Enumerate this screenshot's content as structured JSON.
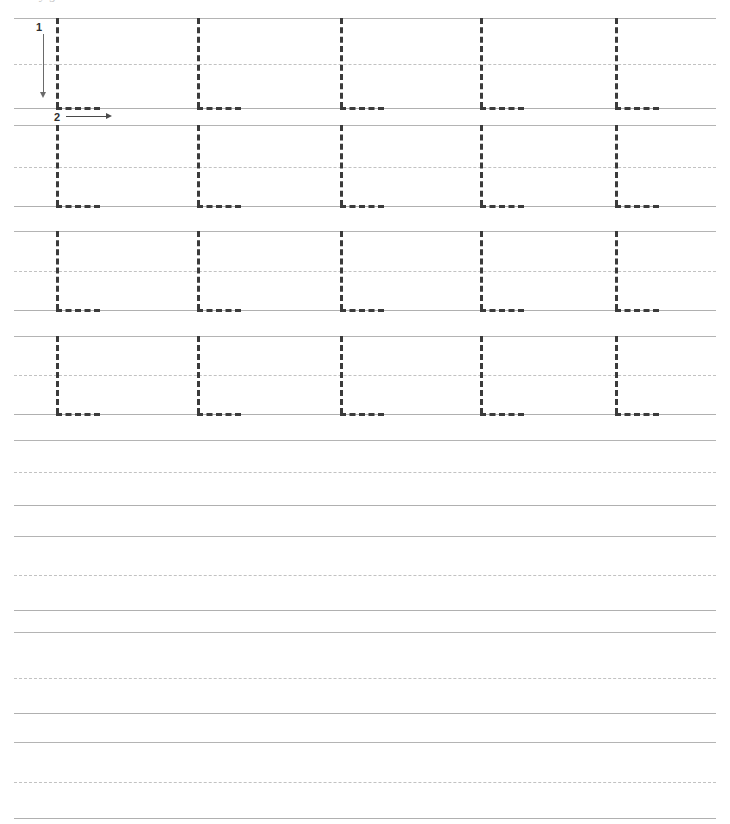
{
  "worksheet": {
    "letter": "L",
    "letter_case": "uppercase",
    "title_remnant": "y g",
    "page_width": 730,
    "page_height": 824,
    "colors": {
      "paper": "#ffffff",
      "rule_solid": "#b4b4b4",
      "rule_dashed": "#c2c2c2",
      "trace_letter": "#3b3b3b",
      "stroke_arrow": "#6a6a6a",
      "stroke_label": "#2e2e2e"
    },
    "layout": {
      "margin_left": 14,
      "margin_right": 14,
      "rule_width": 702,
      "row_height": 92,
      "letter_columns": [
        56,
        197,
        340,
        480,
        615
      ],
      "letter_stem_width": 3,
      "letter_foot_width": 44
    }
  },
  "stroke_guide": {
    "strokes": [
      {
        "number": "1",
        "direction": "down",
        "label": "1"
      },
      {
        "number": "2",
        "direction": "right",
        "label": "2"
      }
    ]
  },
  "rows": [
    {
      "index": 1,
      "kind": "trace",
      "top": 18,
      "mid": 64,
      "base": 108,
      "letters": [
        "L",
        "L",
        "L",
        "L",
        "L"
      ],
      "has_stroke_guide": true
    },
    {
      "index": 2,
      "kind": "trace",
      "top": 125,
      "mid": 167,
      "base": 206,
      "letters": [
        "L",
        "L",
        "L",
        "L",
        "L"
      ],
      "has_stroke_guide": false
    },
    {
      "index": 3,
      "kind": "trace",
      "top": 231,
      "mid": 271,
      "base": 310,
      "letters": [
        "L",
        "L",
        "L",
        "L",
        "L"
      ],
      "has_stroke_guide": false
    },
    {
      "index": 4,
      "kind": "trace",
      "top": 336,
      "mid": 375,
      "base": 414,
      "letters": [
        "L",
        "L",
        "L",
        "L",
        "L"
      ],
      "has_stroke_guide": false
    },
    {
      "index": 5,
      "kind": "blank",
      "top": 440,
      "mid": 472,
      "base": 505,
      "letters": [],
      "has_stroke_guide": false
    },
    {
      "index": 6,
      "kind": "blank",
      "top": 536,
      "mid": 575,
      "base": 610,
      "letters": [],
      "has_stroke_guide": false
    },
    {
      "index": 7,
      "kind": "blank",
      "top": 632,
      "mid": 678,
      "base": 713,
      "letters": [],
      "has_stroke_guide": false
    },
    {
      "index": 8,
      "kind": "blank",
      "top": 742,
      "mid": 782,
      "base": 818,
      "letters": [],
      "has_stroke_guide": false
    }
  ]
}
